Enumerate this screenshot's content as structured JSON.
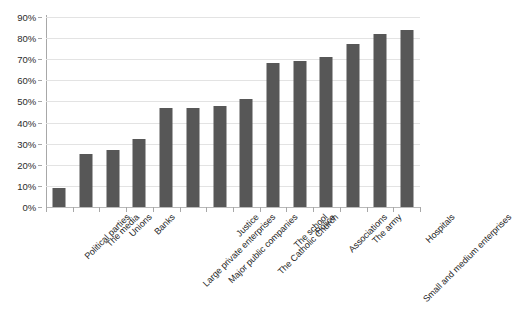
{
  "chart_data": {
    "type": "bar",
    "title": "",
    "subtitle": "",
    "xlabel": "",
    "ylabel": "",
    "ylim": [
      0,
      90
    ],
    "ytick_labels": [
      "0%",
      "10%",
      "20%",
      "30%",
      "40%",
      "50%",
      "60%",
      "70%",
      "80%",
      "90%"
    ],
    "ytick_values": [
      0,
      10,
      20,
      30,
      40,
      50,
      60,
      70,
      80,
      90
    ],
    "grid": true,
    "legend": false,
    "bar_color": "#575757",
    "gridline_color": "#e3e3e3",
    "axis_color": "#a8a8a8",
    "categories": [
      "Political parties",
      "The media",
      "Unions",
      "Banks",
      "Large private enterprises",
      "Major public companies",
      "Justice",
      "The Catholic Church",
      "The school",
      "Police",
      "Associations",
      "The army",
      "Small and medium enterprises",
      "Hospitals"
    ],
    "values": [
      9,
      25,
      27,
      32,
      47,
      47,
      48,
      51,
      68,
      69,
      71,
      77,
      82,
      84
    ]
  }
}
